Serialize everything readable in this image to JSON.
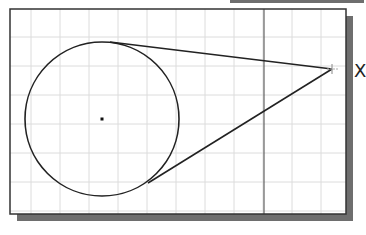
{
  "diagram": {
    "type": "cad-sketch",
    "colors": {
      "background": "#ffffff",
      "frame": "#333333",
      "shadow": "#6e6e6e",
      "grid": "#dcdcdc",
      "geometry": "#222222",
      "axis_line": "#444444"
    },
    "viewport": {
      "x": 10,
      "y": 9,
      "width": 336,
      "height": 205
    },
    "grid": {
      "spacing": 29,
      "origin_x": 8,
      "origin_y": 8
    },
    "circle": {
      "cx": 102,
      "cy": 119,
      "r": 77
    },
    "center_point": {
      "x": 102,
      "y": 119
    },
    "apex_point": {
      "x": 332,
      "y": 69
    },
    "tangent_lines": [
      {
        "from": [
          110,
          42
        ],
        "to": [
          332,
          69
        ]
      },
      {
        "from": [
          148,
          183
        ],
        "to": [
          332,
          69
        ]
      }
    ],
    "vertical_line": {
      "x": 264
    },
    "axis_label": "X"
  }
}
